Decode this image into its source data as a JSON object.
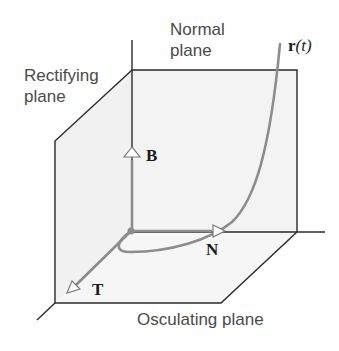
{
  "diagram": {
    "labels": {
      "normal_plane_line1": "Normal",
      "normal_plane_line2": "plane",
      "rectifying_plane_line1": "Rectifying",
      "rectifying_plane_line2": "plane",
      "osculating_plane": "Osculating plane",
      "curve_bold": "r",
      "curve_arg": "(t)",
      "tangent_vector": "T",
      "normal_vector": "N",
      "binormal_vector": "B"
    },
    "colors": {
      "plane_fill": "#f2f2f2",
      "plane_edge": "#2a2a2a",
      "curve": "#8c8c8c",
      "vector": "#8c8c8c",
      "label_sans": "#4a4a4a",
      "label_serif": "#1a1a1a"
    },
    "elements": [
      {
        "name": "normal-plane",
        "type": "plane"
      },
      {
        "name": "rectifying-plane",
        "type": "plane"
      },
      {
        "name": "osculating-plane",
        "type": "plane"
      },
      {
        "name": "curve-r-of-t",
        "type": "curve"
      },
      {
        "name": "tangent-vector-T",
        "type": "vector"
      },
      {
        "name": "normal-vector-N",
        "type": "vector"
      },
      {
        "name": "binormal-vector-B",
        "type": "vector"
      },
      {
        "name": "origin-point",
        "type": "point"
      }
    ]
  }
}
